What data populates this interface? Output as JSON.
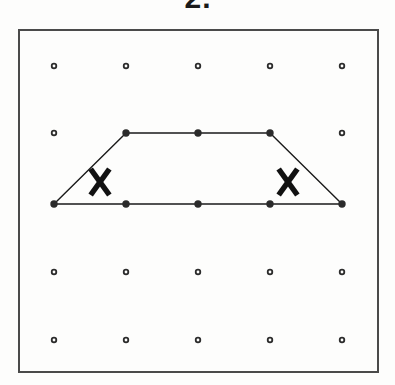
{
  "figure": {
    "problem_label": "2.",
    "label_note": "partially cropped at top edge",
    "board": {
      "name": "geoboard-pegboard",
      "frame": {
        "x": 19,
        "y": 30,
        "width": 359,
        "height": 342
      },
      "frame_color": "#4a4a4a",
      "background_color": "#fdfdfc",
      "peg_color": "#2b2b2b",
      "peg_radius": 3.2,
      "peg_inner_radius": 1.4,
      "columns": 5,
      "rows": 5,
      "column_x": [
        54,
        126,
        198,
        270,
        342
      ],
      "row_y": [
        66,
        133,
        204,
        272,
        340
      ]
    },
    "pegs": [
      {
        "col": 0,
        "row": 0,
        "x": 54,
        "y": 66,
        "on_shape": false
      },
      {
        "col": 1,
        "row": 0,
        "x": 126,
        "y": 66,
        "on_shape": false
      },
      {
        "col": 2,
        "row": 0,
        "x": 198,
        "y": 66,
        "on_shape": false
      },
      {
        "col": 3,
        "row": 0,
        "x": 270,
        "y": 66,
        "on_shape": false
      },
      {
        "col": 4,
        "row": 0,
        "x": 342,
        "y": 66,
        "on_shape": false
      },
      {
        "col": 0,
        "row": 1,
        "x": 54,
        "y": 133,
        "on_shape": false
      },
      {
        "col": 1,
        "row": 1,
        "x": 126,
        "y": 133,
        "on_shape": true
      },
      {
        "col": 2,
        "row": 1,
        "x": 198,
        "y": 133,
        "on_shape": true
      },
      {
        "col": 3,
        "row": 1,
        "x": 270,
        "y": 133,
        "on_shape": true
      },
      {
        "col": 4,
        "row": 1,
        "x": 342,
        "y": 133,
        "on_shape": false
      },
      {
        "col": 0,
        "row": 2,
        "x": 54,
        "y": 204,
        "on_shape": true
      },
      {
        "col": 1,
        "row": 2,
        "x": 126,
        "y": 204,
        "on_shape": true
      },
      {
        "col": 2,
        "row": 2,
        "x": 198,
        "y": 204,
        "on_shape": true
      },
      {
        "col": 3,
        "row": 2,
        "x": 270,
        "y": 204,
        "on_shape": true
      },
      {
        "col": 4,
        "row": 2,
        "x": 342,
        "y": 204,
        "on_shape": true
      },
      {
        "col": 0,
        "row": 3,
        "x": 54,
        "y": 272,
        "on_shape": false
      },
      {
        "col": 1,
        "row": 3,
        "x": 126,
        "y": 272,
        "on_shape": false
      },
      {
        "col": 2,
        "row": 3,
        "x": 198,
        "y": 272,
        "on_shape": false
      },
      {
        "col": 3,
        "row": 3,
        "x": 270,
        "y": 272,
        "on_shape": false
      },
      {
        "col": 4,
        "row": 3,
        "x": 342,
        "y": 272,
        "on_shape": false
      },
      {
        "col": 0,
        "row": 4,
        "x": 54,
        "y": 340,
        "on_shape": false
      },
      {
        "col": 1,
        "row": 4,
        "x": 126,
        "y": 340,
        "on_shape": false
      },
      {
        "col": 2,
        "row": 4,
        "x": 198,
        "y": 340,
        "on_shape": false
      },
      {
        "col": 3,
        "row": 4,
        "x": 270,
        "y": 340,
        "on_shape": false
      },
      {
        "col": 4,
        "row": 4,
        "x": 342,
        "y": 340,
        "on_shape": false
      }
    ],
    "shape": {
      "name": "trapezoid",
      "stroke_color": "#1a1a1a",
      "stroke_width": 1.4,
      "fill": "none",
      "vertices": [
        {
          "label": "top-left",
          "x": 126,
          "y": 133
        },
        {
          "label": "top-right",
          "x": 270,
          "y": 133
        },
        {
          "label": "bottom-right",
          "x": 342,
          "y": 204
        },
        {
          "label": "bottom-left",
          "x": 54,
          "y": 204
        }
      ],
      "edges": [
        {
          "from": "top-left",
          "to": "top-right",
          "kind": "parallel-top"
        },
        {
          "from": "top-right",
          "to": "bottom-right",
          "kind": "slant-right"
        },
        {
          "from": "bottom-right",
          "to": "bottom-left",
          "kind": "parallel-bottom"
        },
        {
          "from": "bottom-left",
          "to": "top-left",
          "kind": "slant-left"
        }
      ]
    },
    "marks": [
      {
        "name": "congruence-mark-left",
        "glyph": "X",
        "x": 100,
        "y": 182,
        "size": 26,
        "color": "#111111"
      },
      {
        "name": "congruence-mark-right",
        "glyph": "X",
        "x": 288,
        "y": 182,
        "size": 26,
        "color": "#111111"
      }
    ]
  }
}
